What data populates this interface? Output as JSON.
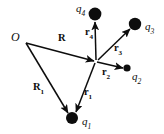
{
  "figure": {
    "type": "vector-diagram",
    "background_color": "#ffffff",
    "ink_color": "#0d0d0d",
    "width": 164,
    "height": 134
  },
  "origin": {
    "label": "O",
    "label_x": 11,
    "label_y": 31,
    "point_x": 26,
    "point_y": 43
  },
  "reference_point": {
    "x": 96,
    "y": 61
  },
  "charges": [
    {
      "name": "q1",
      "label_main": "q",
      "label_sub": "1",
      "x": 72,
      "y": 118,
      "radius": 6,
      "label_x": 82,
      "label_y": 116
    },
    {
      "name": "q2",
      "label_main": "q",
      "label_sub": "2",
      "x": 127,
      "y": 68,
      "radius": 3.6,
      "label_x": 132,
      "label_y": 71
    },
    {
      "name": "q3",
      "label_main": "q",
      "label_sub": "3",
      "x": 135,
      "y": 24,
      "radius": 6.2,
      "label_x": 145,
      "label_y": 21
    },
    {
      "name": "q4",
      "label_main": "q",
      "label_sub": "4",
      "x": 95,
      "y": 14,
      "radius": 6.4,
      "label_x": 76,
      "label_y": 3
    }
  ],
  "vectors": [
    {
      "name": "R",
      "label_main": "R",
      "label_sub": "",
      "from_x": 26,
      "from_y": 43,
      "to_x": 94,
      "to_y": 61,
      "label_x": 58,
      "label_y": 33
    },
    {
      "name": "R1",
      "label_main": "R",
      "label_sub": "1",
      "from_x": 26,
      "from_y": 43,
      "to_x": 68,
      "to_y": 113,
      "label_x": 33,
      "label_y": 82
    },
    {
      "name": "r1",
      "label_main": "r",
      "label_sub": "1",
      "from_x": 95,
      "from_y": 63,
      "to_x": 76,
      "to_y": 112,
      "label_x": 84,
      "label_y": 87
    },
    {
      "name": "r2",
      "label_main": "r",
      "label_sub": "2",
      "from_x": 97,
      "from_y": 62,
      "to_x": 123,
      "to_y": 68,
      "label_x": 102,
      "label_y": 67
    },
    {
      "name": "r3",
      "label_main": "r",
      "label_sub": "3",
      "from_x": 98,
      "from_y": 60,
      "to_x": 130,
      "to_y": 29,
      "label_x": 114,
      "label_y": 43
    },
    {
      "name": "r4",
      "label_main": "r",
      "label_sub": "4",
      "from_x": 96,
      "from_y": 60,
      "to_x": 95,
      "to_y": 22,
      "label_x": 85,
      "label_y": 27
    }
  ]
}
